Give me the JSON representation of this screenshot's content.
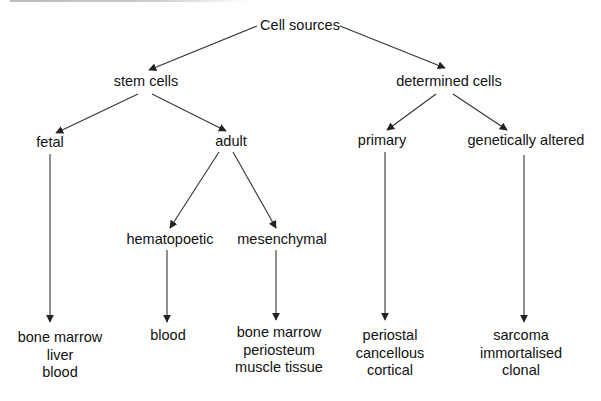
{
  "diagram": {
    "type": "tree",
    "root": "Cell sources",
    "nodes": {
      "root": {
        "label": "Cell sources"
      },
      "stem": {
        "label": "stem cells"
      },
      "determined": {
        "label": "determined cells"
      },
      "fetal": {
        "label": "fetal"
      },
      "adult": {
        "label": "adult"
      },
      "primary": {
        "label": "primary"
      },
      "genetic": {
        "label": "genetically altered"
      },
      "hemato": {
        "label": "hematopoetic"
      },
      "mesen": {
        "label": "mesenchymal"
      },
      "fetal_leaf": {
        "lines": [
          "bone marrow",
          "liver",
          "blood"
        ]
      },
      "hemato_leaf": {
        "lines": [
          "blood"
        ]
      },
      "mesen_leaf": {
        "lines": [
          "bone marrow",
          "periosteum",
          "muscle tissue"
        ]
      },
      "primary_leaf": {
        "lines": [
          "periostal",
          "cancellous",
          "cortical"
        ]
      },
      "genetic_leaf": {
        "lines": [
          "sarcoma",
          "immortalised",
          "clonal"
        ]
      }
    },
    "edges": [
      [
        "Cell sources",
        "stem cells"
      ],
      [
        "Cell sources",
        "determined cells"
      ],
      [
        "stem cells",
        "fetal"
      ],
      [
        "stem cells",
        "adult"
      ],
      [
        "determined cells",
        "primary"
      ],
      [
        "determined cells",
        "genetically altered"
      ],
      [
        "adult",
        "hematopoetic"
      ],
      [
        "adult",
        "mesenchymal"
      ],
      [
        "fetal",
        "bone marrow / liver / blood"
      ],
      [
        "hematopoetic",
        "blood"
      ],
      [
        "mesenchymal",
        "bone marrow / periosteum / muscle tissue"
      ],
      [
        "primary",
        "periostal / cancellous / cortical"
      ],
      [
        "genetically altered",
        "sarcoma / immortalised / clonal"
      ]
    ],
    "colors": {
      "line": "#222222",
      "text": "#111111",
      "background": "#ffffff"
    }
  }
}
